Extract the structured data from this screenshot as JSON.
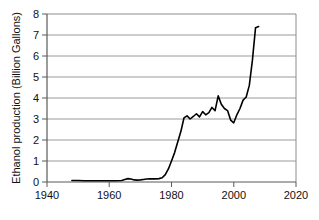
{
  "chart_data": {
    "type": "line",
    "title": "",
    "xlabel": "",
    "ylabel": "Ethanol production (Billion Gallons)",
    "xlim": [
      1940,
      2020
    ],
    "ylim": [
      0,
      8
    ],
    "xticks": [
      1940,
      1960,
      1980,
      2000,
      2020
    ],
    "xtick_labels": [
      "1940",
      "1960",
      "1980",
      "2000",
      "2020"
    ],
    "yticks": [
      0,
      1,
      2,
      3,
      4,
      5,
      6,
      7,
      8
    ],
    "ytick_labels": [
      "0",
      "1",
      "2",
      "3",
      "4",
      "5",
      "6",
      "7",
      "8"
    ],
    "grid": "horizontal",
    "grid_color": "#9a9a9a",
    "line_color": "#000000",
    "line_width": 1.6,
    "legend": "none",
    "series": [
      {
        "name": "Ethanol production",
        "x": [
          1948,
          1950,
          1952,
          1954,
          1956,
          1958,
          1960,
          1962,
          1964,
          1965,
          1966,
          1967,
          1968,
          1969,
          1970,
          1971,
          1972,
          1973,
          1974,
          1975,
          1976,
          1977,
          1978,
          1979,
          1980,
          1981,
          1982,
          1983,
          1984,
          1985,
          1986,
          1987,
          1988,
          1989,
          1990,
          1991,
          1992,
          1993,
          1994,
          1995,
          1996,
          1997,
          1998,
          1999,
          2000,
          2001,
          2002,
          2003,
          2004,
          2005,
          2006,
          2007,
          2008
        ],
        "values": [
          0.07,
          0.07,
          0.06,
          0.06,
          0.06,
          0.06,
          0.06,
          0.06,
          0.07,
          0.12,
          0.16,
          0.14,
          0.1,
          0.09,
          0.1,
          0.12,
          0.14,
          0.15,
          0.15,
          0.15,
          0.16,
          0.2,
          0.35,
          0.62,
          1.0,
          1.4,
          1.9,
          2.4,
          3.05,
          3.15,
          3.0,
          3.12,
          3.25,
          3.1,
          3.35,
          3.2,
          3.3,
          3.55,
          3.4,
          4.1,
          3.7,
          3.5,
          3.4,
          2.95,
          2.82,
          3.2,
          3.5,
          3.9,
          4.05,
          4.6,
          5.8,
          7.35,
          7.4
        ]
      }
    ],
    "annotations": []
  },
  "axis": {
    "frame_color": "#8c8c8c",
    "tick_color": "#555555"
  }
}
